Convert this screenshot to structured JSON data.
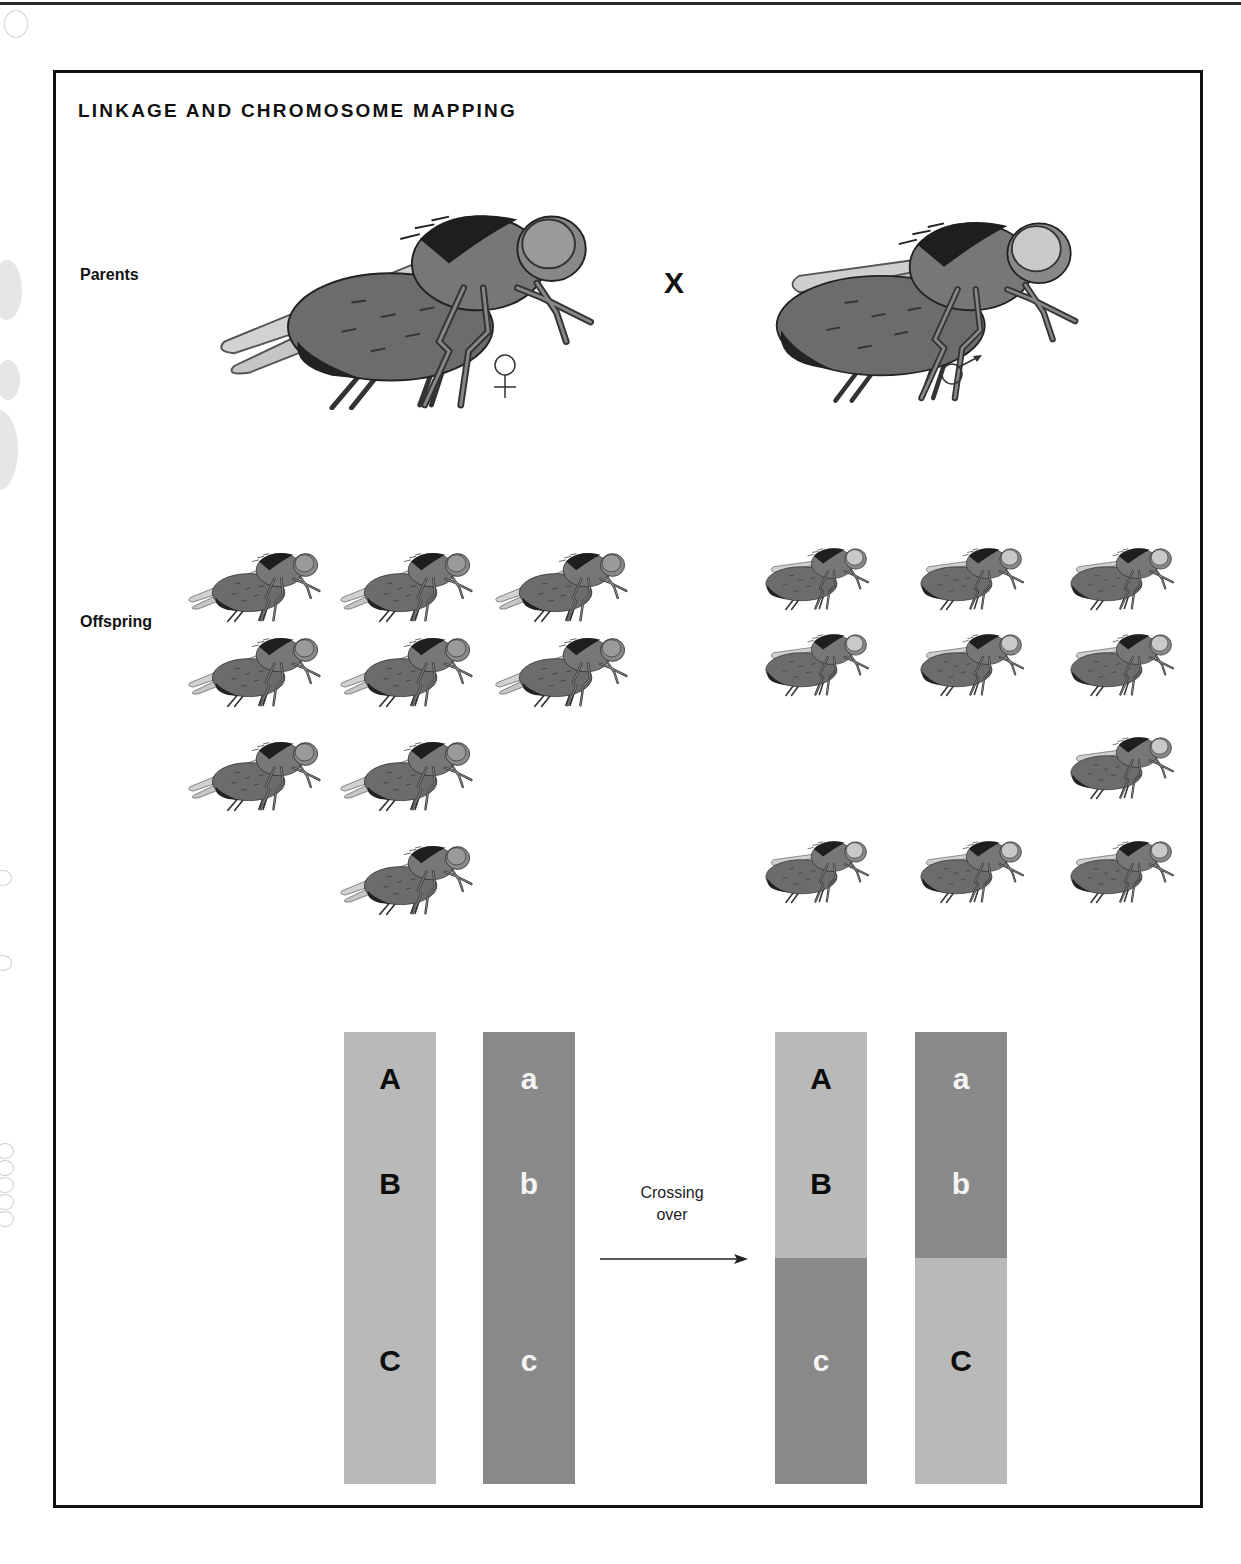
{
  "header": {
    "title": "LINKAGE AND CHROMOSOME MAPPING"
  },
  "parents": {
    "label": "Parents",
    "cross_symbol": "X",
    "female": {
      "sex": "female",
      "symbol_icon": "female-symbol-icon",
      "wings": "normal-long"
    },
    "male": {
      "sex": "male",
      "symbol_icon": "male-symbol-icon",
      "wings": "short"
    }
  },
  "offspring": {
    "label": "Offspring",
    "left_group": {
      "phenotype": "long-wing, dark eye",
      "rows": [
        3,
        3,
        2,
        1
      ],
      "total": 9
    },
    "right_group": {
      "phenotype": "short-wing, light eye",
      "rows": [
        3,
        3,
        1,
        3
      ],
      "total": 10
    }
  },
  "crossing_over": {
    "label_line1": "Crossing",
    "label_line2": "over",
    "colors": {
      "light": "#b9b9b9",
      "dark": "#898989"
    },
    "before": [
      {
        "alleles": [
          "A",
          "B",
          "C"
        ],
        "shade": "light"
      },
      {
        "alleles": [
          "a",
          "b",
          "c"
        ],
        "shade": "dark"
      }
    ],
    "after": [
      {
        "alleles": [
          "A",
          "B",
          "c"
        ],
        "top_shade": "light",
        "bottom_shade": "dark"
      },
      {
        "alleles": [
          "a",
          "b",
          "C"
        ],
        "top_shade": "dark",
        "bottom_shade": "light"
      }
    ]
  }
}
